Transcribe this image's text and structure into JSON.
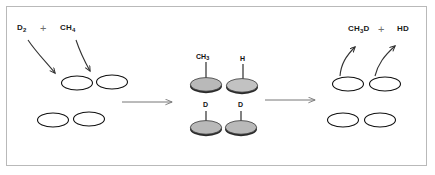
{
  "figure": {
    "background_color": "#ffffff",
    "frame_color": "#b9b9b9"
  },
  "reactants": {
    "species_1": "D",
    "species_1_sub": "2",
    "plus": "+",
    "species_2": "CH",
    "species_2_sub": "4"
  },
  "products": {
    "species_1": "CH",
    "species_1_sub": "3",
    "species_1_tail": "D",
    "plus": "+",
    "species_2": "HD"
  },
  "adsorbates": {
    "top_left": "CH",
    "top_left_sub": "3",
    "top_right": "H",
    "bottom_left": "D",
    "bottom_right": "D"
  },
  "colors": {
    "outline": "#111111",
    "surface_fill": "#ffffff",
    "occupied_fill": "#b5b5b5",
    "occupied_rim": "#2a2a2a",
    "arrow": "#777777",
    "curved_arrow": "#333333",
    "text": "#111111",
    "plus_sign": "#6e6e6e"
  },
  "stages": [
    {
      "name": "reactants-surface",
      "sites_top": 2,
      "sites_bottom": 2,
      "occupied": false
    },
    {
      "name": "adsorbed-intermediate",
      "sites_top": 2,
      "sites_bottom": 2,
      "occupied": true
    },
    {
      "name": "products-surface",
      "sites_top": 2,
      "sites_bottom": 2,
      "occupied": false
    }
  ],
  "arrows": {
    "reaction_arrow_1": "right-arrow",
    "reaction_arrow_2": "right-arrow",
    "inbound_1": "curved-down-arrow",
    "inbound_2": "curved-down-arrow",
    "outbound_1": "curved-up-arrow",
    "outbound_2": "curved-up-arrow"
  }
}
